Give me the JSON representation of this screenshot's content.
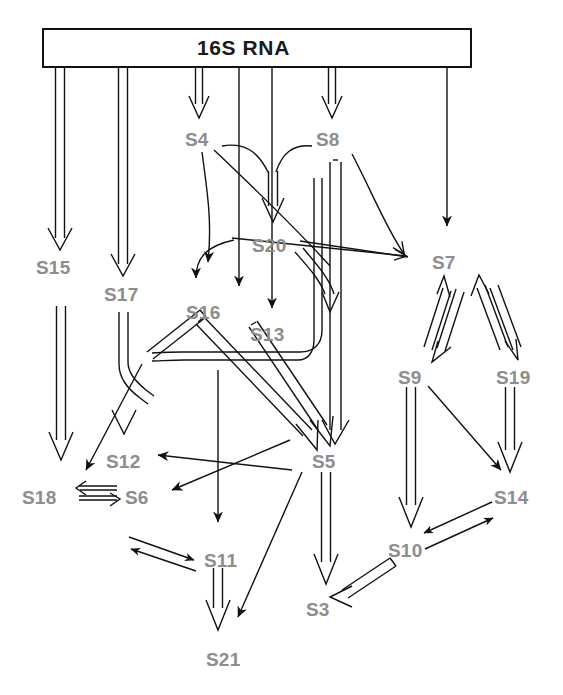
{
  "diagram": {
    "title": "16S RNA",
    "kind": "ribosomal-protein-assembly-map",
    "label_color": "#8d8d8d",
    "title_color": "#1a1a1a",
    "line_color": "#111111",
    "background": "#ffffff",
    "rna_box": {
      "label": "16S RNA",
      "x": 42,
      "y": 28,
      "width": 430,
      "height": 40
    },
    "nodes": [
      {
        "id": "S15",
        "label": "S15",
        "x": 36,
        "y": 258
      },
      {
        "id": "S17",
        "label": "S17",
        "x": 104,
        "y": 285
      },
      {
        "id": "S4",
        "label": "S4",
        "x": 185,
        "y": 130
      },
      {
        "id": "S8",
        "label": "S8",
        "x": 316,
        "y": 130
      },
      {
        "id": "S20",
        "label": "S20",
        "x": 252,
        "y": 236
      },
      {
        "id": "S16",
        "label": "S16",
        "x": 186,
        "y": 303
      },
      {
        "id": "S13",
        "label": "S13",
        "x": 250,
        "y": 325
      },
      {
        "id": "S7",
        "label": "S7",
        "x": 432,
        "y": 253
      },
      {
        "id": "S9",
        "label": "S9",
        "x": 398,
        "y": 368
      },
      {
        "id": "S19",
        "label": "S19",
        "x": 496,
        "y": 368
      },
      {
        "id": "S12",
        "label": "S12",
        "x": 106,
        "y": 452
      },
      {
        "id": "S18",
        "label": "S18",
        "x": 22,
        "y": 488
      },
      {
        "id": "S6",
        "label": "S6",
        "x": 125,
        "y": 488
      },
      {
        "id": "S5",
        "label": "S5",
        "x": 312,
        "y": 452
      },
      {
        "id": "S14",
        "label": "S14",
        "x": 494,
        "y": 488
      },
      {
        "id": "S10",
        "label": "S10",
        "x": 388,
        "y": 541
      },
      {
        "id": "S11",
        "label": "S11",
        "x": 204,
        "y": 551
      },
      {
        "id": "S3",
        "label": "S3",
        "x": 306,
        "y": 600
      },
      {
        "id": "S21",
        "label": "S21",
        "x": 206,
        "y": 650
      }
    ],
    "edges": [
      {
        "from": "16S RNA",
        "to": "S15",
        "style": "thick-hollow"
      },
      {
        "from": "16S RNA",
        "to": "S17",
        "style": "thick-hollow"
      },
      {
        "from": "16S RNA",
        "to": "S4",
        "style": "thin-hollow"
      },
      {
        "from": "16S RNA",
        "to": "S8",
        "style": "thin-hollow"
      },
      {
        "from": "16S RNA",
        "to": "S16",
        "style": "line-solid-head"
      },
      {
        "from": "16S RNA",
        "to": "S20",
        "style": "thin-hollow"
      },
      {
        "from": "16S RNA",
        "to": "S13",
        "style": "line-solid-head"
      },
      {
        "from": "16S RNA",
        "to": "S7",
        "style": "line-solid-head"
      },
      {
        "from": "S4",
        "to": "S20",
        "style": "curve"
      },
      {
        "from": "S8",
        "to": "S20",
        "style": "curve"
      },
      {
        "from": "S4",
        "to": "S16",
        "style": "curve-solid-head"
      },
      {
        "from": "S4",
        "to": "S5",
        "style": "curve"
      },
      {
        "from": "S4",
        "to": "S7",
        "style": "thin-hollow-head"
      },
      {
        "from": "S8",
        "to": "S7",
        "style": "curve-hollow-head"
      },
      {
        "from": "S8",
        "to": "S5",
        "style": "thick-hollow"
      },
      {
        "from": "S20",
        "to": "S13",
        "style": "thin-hollow"
      },
      {
        "from": "S20",
        "to": "S16",
        "style": "curve-solid-head"
      },
      {
        "from": "S20",
        "to": "S7",
        "style": "line"
      },
      {
        "from": "S16",
        "to": "S5",
        "style": "thick-hollow"
      },
      {
        "from": "S13",
        "to": "S5",
        "style": "thick-hollow"
      },
      {
        "from": "S17",
        "to": "S12",
        "style": "thick-hollow"
      },
      {
        "from": "S17",
        "to": "S18",
        "style": "line-solid-head"
      },
      {
        "from": "S15",
        "to": "S18",
        "style": "thick-hollow"
      },
      {
        "from": "S18",
        "to": "S6",
        "style": "bidirectional-hollow"
      },
      {
        "from": "S5",
        "to": "S12",
        "style": "line-solid-head"
      },
      {
        "from": "S5",
        "to": "S6",
        "style": "line-solid-head"
      },
      {
        "from": "S16",
        "to": "S11",
        "style": "line-solid-head"
      },
      {
        "from": "S6",
        "to": "S11",
        "style": "bidirectional-thin"
      },
      {
        "from": "S11",
        "to": "S21",
        "style": "thick-hollow"
      },
      {
        "from": "S5",
        "to": "S21",
        "style": "line-solid-head"
      },
      {
        "from": "S5",
        "to": "S3",
        "style": "thick-hollow"
      },
      {
        "from": "S7",
        "to": "S9",
        "style": "bidirectional-hollow"
      },
      {
        "from": "S7",
        "to": "S19",
        "style": "bidirectional-hollow"
      },
      {
        "from": "S9",
        "to": "S10",
        "style": "thick-hollow"
      },
      {
        "from": "S9",
        "to": "S14",
        "style": "line-solid-head"
      },
      {
        "from": "S19",
        "to": "S14",
        "style": "thick-hollow"
      },
      {
        "from": "S10",
        "to": "S14",
        "style": "bidirectional-thin"
      },
      {
        "from": "S10",
        "to": "S3",
        "style": "thick-hollow"
      }
    ]
  }
}
